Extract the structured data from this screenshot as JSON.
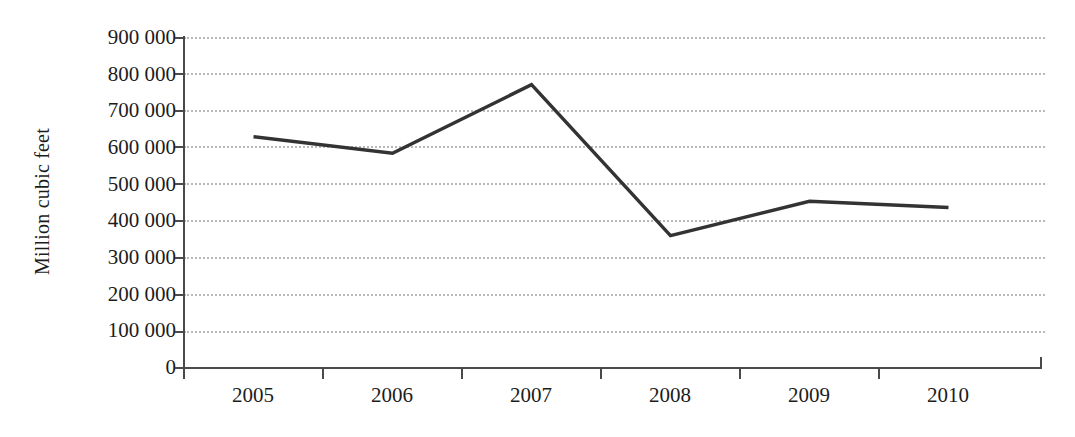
{
  "chart_data": {
    "type": "line",
    "title": "",
    "xlabel": "",
    "ylabel": "Million cubic feet",
    "categories": [
      "2005",
      "2006",
      "2007",
      "2008",
      "2009",
      "2010"
    ],
    "series": [
      {
        "name": "Million cubic feet",
        "values": [
          628000,
          583000,
          770000,
          358000,
          452000,
          435000
        ],
        "color": "#333333"
      }
    ],
    "ylim": [
      0,
      900000
    ],
    "y_ticks": [
      900000,
      800000,
      700000,
      600000,
      500000,
      400000,
      300000,
      200000,
      100000,
      0
    ],
    "y_tick_labels": [
      "900 000",
      "800 000",
      "700 000",
      "600 000",
      "500 000",
      "400 000",
      "300 000",
      "200 000",
      "100 000",
      "0"
    ],
    "grid": true,
    "grid_style": "dotted",
    "grid_color": "#b9b9b9",
    "legend": false,
    "legend_position": "none",
    "axis_color": "#4a4a4a",
    "background": "#ffffff"
  }
}
